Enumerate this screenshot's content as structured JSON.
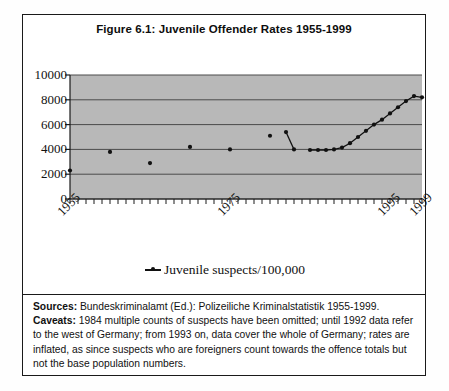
{
  "figure": {
    "title": "Figure 6.1: Juvenile Offender Rates 1955-1999"
  },
  "legend": {
    "symbol_name": "line-marker-symbol",
    "label": "Juvenile suspects/100,000"
  },
  "footer": {
    "sources_label": "Sources:",
    "sources_text": " Bundeskriminalamt (Ed.): Polizeiliche Kriminalstatistik 1955-1999.",
    "caveats_label": "Caveats:",
    "caveats_text": " 1984 multiple counts of suspects have been omitted; until 1992 data refer to the west of Germany; from 1993 on, data cover the whole of Germany; rates are inflated, as since suspects who are foreigners count towards the offence totals but not the base population numbers."
  },
  "colors": {
    "plot_background": "#b8b8b8",
    "gridline": "#4a4a4a",
    "axis": "#1a1a1a",
    "marker": "#111111",
    "frame": "#1a1a1a"
  },
  "chart_data": {
    "type": "line",
    "title": "Figure 6.1: Juvenile Offender Rates 1955-1999",
    "xlabel": "",
    "ylabel": "",
    "xlim": [
      1955,
      1999
    ],
    "ylim": [
      0,
      10000
    ],
    "ytick_labels": [
      "10000",
      "8000",
      "6000",
      "4000",
      "2000",
      "0"
    ],
    "yticks": [
      10000,
      8000,
      6000,
      4000,
      2000,
      0
    ],
    "xtick_labels": [
      "1955",
      "1975",
      "1995",
      "1999"
    ],
    "xticks": [
      1955,
      1975,
      1995,
      1999
    ],
    "grid": true,
    "legend_position": "bottom-center",
    "series": [
      {
        "name": "Juvenile suspects/100,000",
        "x": [
          1955,
          1960,
          1965,
          1970,
          1975,
          1980,
          1982,
          1983,
          1984,
          1985,
          1986,
          1987,
          1988,
          1989,
          1990,
          1991,
          1992,
          1993,
          1994,
          1995,
          1996,
          1997,
          1998,
          1999
        ],
        "values": [
          2300,
          3800,
          2900,
          4200,
          4000,
          5100,
          5400,
          4000,
          null,
          3950,
          3950,
          3950,
          4000,
          4150,
          4500,
          5000,
          5500,
          6000,
          6400,
          6900,
          7400,
          7900,
          8300,
          8200
        ]
      }
    ]
  }
}
